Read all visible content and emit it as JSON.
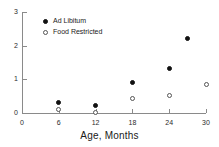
{
  "chart_data": {
    "type": "scatter",
    "title": "",
    "xlabel": "Age, Months",
    "ylabel": "",
    "xlim": [
      0,
      30
    ],
    "ylim": [
      0,
      3
    ],
    "xticks": [
      0,
      6,
      12,
      18,
      24,
      30
    ],
    "xtick_labels": [
      "0",
      "6",
      "12",
      "18",
      "24",
      "30"
    ],
    "yticks": [
      0,
      1,
      2,
      3
    ],
    "ytick_labels": [
      "0",
      "1",
      "2",
      "3"
    ],
    "grid": false,
    "legend_position": "upper-left",
    "series": [
      {
        "name": "Ad Libitum",
        "marker": "filled-circle",
        "color": "#111111",
        "points": [
          {
            "x": 6,
            "y": 0.32
          },
          {
            "x": 12,
            "y": 0.22
          },
          {
            "x": 18,
            "y": 0.92
          },
          {
            "x": 24,
            "y": 1.32
          },
          {
            "x": 27,
            "y": 2.2
          }
        ]
      },
      {
        "name": "Food Restricted",
        "marker": "open-circle",
        "color": "#555555",
        "points": [
          {
            "x": 6,
            "y": 0.1
          },
          {
            "x": 12,
            "y": 0.02
          },
          {
            "x": 18,
            "y": 0.43
          },
          {
            "x": 24,
            "y": 0.53
          },
          {
            "x": 30,
            "y": 0.85
          }
        ]
      }
    ]
  },
  "legend": {
    "items": [
      {
        "label": "Ad Libitum",
        "marker": "filled-circle"
      },
      {
        "label": "Food Restricted",
        "marker": "open-circle"
      }
    ]
  },
  "axes": {
    "x_title": "Age, Months"
  }
}
